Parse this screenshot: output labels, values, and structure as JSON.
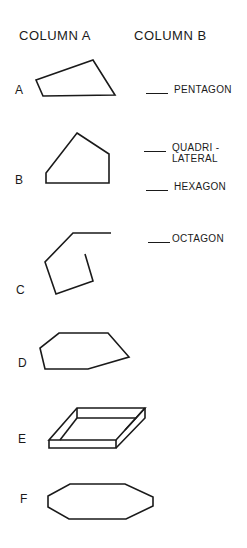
{
  "headers": {
    "column_a": "COLUMN A",
    "column_b": "COLUMN B"
  },
  "column_a": [
    {
      "label": "A",
      "shape": "quadrilateral"
    },
    {
      "label": "B",
      "shape": "pentagon"
    },
    {
      "label": "C",
      "shape": "open-figure"
    },
    {
      "label": "D",
      "shape": "hexagon"
    },
    {
      "label": "E",
      "shape": "3d-box"
    },
    {
      "label": "F",
      "shape": "octagon"
    }
  ],
  "column_b": [
    {
      "text": "PENTAGON"
    },
    {
      "text": "QUADRI -",
      "text2": "LATERAL"
    },
    {
      "text": "HEXAGON"
    },
    {
      "text": "OCTAGON"
    }
  ]
}
